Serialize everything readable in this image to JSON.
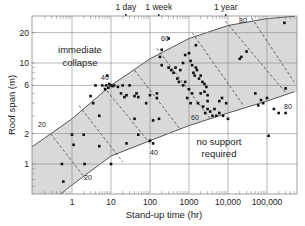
{
  "chart_data": {
    "type": "scatter",
    "title": "",
    "xlabel": "Stand-up time (hr)",
    "ylabel": "Roof span (m)",
    "x_scale": "log",
    "y_scale": "log",
    "xlim": [
      0.1,
      500000
    ],
    "ylim": [
      0.5,
      30
    ],
    "grid": true,
    "x_ticks": [
      {
        "value": 1,
        "label": "1"
      },
      {
        "value": 10,
        "label": "10"
      },
      {
        "value": 100,
        "label": "100"
      },
      {
        "value": 1000,
        "label": "1000"
      },
      {
        "value": 10000,
        "label": "10,000"
      },
      {
        "value": 100000,
        "label": "100,000"
      }
    ],
    "y_ticks": [
      {
        "value": 1,
        "label": "1"
      },
      {
        "value": 2,
        "label": "2"
      },
      {
        "value": 6,
        "label": "6"
      },
      {
        "value": 10,
        "label": "10"
      },
      {
        "value": 20,
        "label": "20"
      }
    ],
    "top_annotations": [
      {
        "value": 24,
        "label": "1 day"
      },
      {
        "value": 168,
        "label": "1 week"
      },
      {
        "value": 8760,
        "label": "1 year"
      }
    ],
    "region_labels": [
      {
        "text": [
          "immediate",
          "collapse"
        ],
        "x": 3.5,
        "y": 11
      },
      {
        "text": [
          "no support",
          "required"
        ],
        "x": 3000,
        "y": 1.0
      }
    ],
    "rmr_lines": [
      {
        "label": "20",
        "points": [
          [
            0.28,
            2.0
          ],
          [
            2.2,
            0.72
          ]
        ]
      },
      {
        "label": "40",
        "points": [
          [
            6.5,
            5.8
          ],
          [
            100,
            1.6
          ]
        ]
      },
      {
        "label": "60",
        "points": [
          [
            150,
            14
          ],
          [
            3500,
            2.8
          ]
        ]
      },
      {
        "label": "80",
        "points": [
          [
            8500,
            26
          ],
          [
            300000,
            5.1
          ]
        ]
      }
    ],
    "series": [
      {
        "name": "Case histories",
        "points": [
          [
            0.55,
            1.0
          ],
          [
            0.6,
            0.67
          ],
          [
            1.0,
            1.95
          ],
          [
            1.1,
            1.55
          ],
          [
            2.0,
            1.95
          ],
          [
            2.1,
            1.0
          ],
          [
            5,
            1.5
          ],
          [
            10,
            1.0
          ],
          [
            25,
            1.6
          ],
          [
            50,
            1.95
          ],
          [
            100,
            1.7
          ],
          [
            120,
            1.6
          ],
          [
            3.0,
            4.7
          ],
          [
            3.5,
            4.0
          ],
          [
            4.0,
            6.0
          ],
          [
            5,
            3.0
          ],
          [
            6,
            6.0
          ],
          [
            7,
            5.5
          ],
          [
            7.5,
            6.0
          ],
          [
            8,
            7.5
          ],
          [
            8.5,
            5.7
          ],
          [
            9,
            6.2
          ],
          [
            10,
            6.0
          ],
          [
            11,
            5.9
          ],
          [
            12,
            6.0
          ],
          [
            15,
            5.8
          ],
          [
            18,
            5.0
          ],
          [
            20,
            6.0
          ],
          [
            22,
            4.6
          ],
          [
            25,
            4.8
          ],
          [
            30,
            6.0
          ],
          [
            40,
            4.7
          ],
          [
            45,
            5.0
          ],
          [
            50,
            4.6
          ],
          [
            40,
            2.8
          ],
          [
            80,
            4.0
          ],
          [
            100,
            4.8
          ],
          [
            150,
            4.5
          ],
          [
            180,
            11.5
          ],
          [
            200,
            9.5
          ],
          [
            200,
            13.5
          ],
          [
            300,
            17.5
          ],
          [
            150,
            5.0
          ],
          [
            120,
            2.7
          ],
          [
            170,
            2.8
          ],
          [
            300,
            9.0
          ],
          [
            350,
            8.5
          ],
          [
            400,
            8.0
          ],
          [
            450,
            9.0
          ],
          [
            600,
            8.5
          ],
          [
            700,
            10.0
          ],
          [
            800,
            12.0
          ],
          [
            500,
            7.0
          ],
          [
            550,
            6.5
          ],
          [
            700,
            6.0
          ],
          [
            800,
            6.5
          ],
          [
            1000,
            5.5
          ],
          [
            1200,
            5.0
          ],
          [
            900,
            4.5
          ],
          [
            1100,
            4.0
          ],
          [
            1000,
            12.5
          ],
          [
            1100,
            10.5
          ],
          [
            1200,
            9.5
          ],
          [
            1300,
            8.0
          ],
          [
            1400,
            7.5
          ],
          [
            1500,
            9.0
          ],
          [
            1600,
            8.5
          ],
          [
            1800,
            7.0
          ],
          [
            2000,
            7.5
          ],
          [
            2200,
            6.5
          ],
          [
            2500,
            5.2
          ],
          [
            2800,
            5.8
          ],
          [
            3000,
            4.8
          ],
          [
            1500,
            15.0
          ],
          [
            2000,
            5.0
          ],
          [
            2500,
            6.2
          ],
          [
            3000,
            4.2
          ],
          [
            1700,
            4.0
          ],
          [
            2300,
            3.7
          ],
          [
            2600,
            3.2
          ],
          [
            3000,
            3.5
          ],
          [
            3500,
            3.3
          ],
          [
            4000,
            3.0
          ],
          [
            4500,
            3.5
          ],
          [
            5000,
            3.0
          ],
          [
            6000,
            4.2
          ],
          [
            7000,
            4.5
          ],
          [
            9000,
            4.0
          ],
          [
            6000,
            3.2
          ],
          [
            7500,
            3.0
          ],
          [
            10000,
            2.8
          ],
          [
            20000,
            11.0
          ],
          [
            22000,
            11.5
          ],
          [
            30000,
            13.0
          ],
          [
            50000,
            5.0
          ],
          [
            60000,
            3.8
          ],
          [
            70000,
            4.3
          ],
          [
            80000,
            4.0
          ],
          [
            100000,
            4.5
          ],
          [
            150000,
            3.5
          ],
          [
            200000,
            3.2
          ],
          [
            300000,
            3.2
          ],
          [
            300000,
            5.6
          ],
          [
            280000,
            25.0
          ],
          [
            110000,
            1.9
          ]
        ]
      }
    ],
    "envelope": {
      "upper": [
        [
          0.1,
          1.5
        ],
        [
          1,
          2.8
        ],
        [
          10,
          6.0
        ],
        [
          100,
          11.0
        ],
        [
          1000,
          17.5
        ],
        [
          10000,
          23.5
        ],
        [
          100000,
          27.5
        ],
        [
          500000,
          29
        ]
      ],
      "lower": [
        [
          0.5,
          0.5
        ],
        [
          1,
          0.62
        ],
        [
          10,
          1.2
        ],
        [
          100,
          1.7
        ],
        [
          1000,
          2.4
        ],
        [
          10000,
          3.2
        ],
        [
          100000,
          4.2
        ],
        [
          500000,
          5.2
        ]
      ]
    }
  }
}
